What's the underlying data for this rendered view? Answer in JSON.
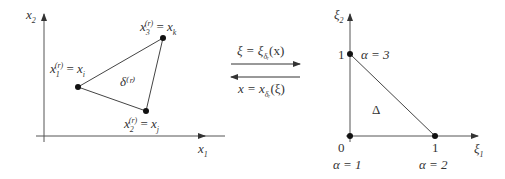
{
  "left_panel": {
    "axis_x_label": "x₁",
    "axis_y_label": "x₂",
    "element_label": "δ⁽ʳ⁾",
    "vertices": [
      {
        "name": "x₁⁽ʳ⁾ = xᵢ",
        "label_base": "x",
        "label_sub": "1",
        "label_sup": "(r)",
        "rhs_base": "x",
        "rhs_sub": "i",
        "point": [
          78,
          87
        ]
      },
      {
        "name": "x₂⁽ʳ⁾ = xⱼ",
        "label_base": "x",
        "label_sub": "2",
        "label_sup": "(r)",
        "rhs_base": "x",
        "rhs_sub": "j",
        "point": [
          146,
          111
        ]
      },
      {
        "name": "x₃⁽ʳ⁾ = xₖ",
        "label_base": "x",
        "label_sub": "3",
        "label_sup": "(r)",
        "rhs_base": "x",
        "rhs_sub": "k",
        "point": [
          163,
          38
        ]
      }
    ]
  },
  "mapping": {
    "forward": "ξ = ξδᵣ(x)",
    "forward_lhs": "ξ = ξ",
    "forward_sub": "δᵣ",
    "forward_arg": "(x)",
    "inverse": "x = xδᵣ(ξ)",
    "inverse_lhs": "x = x",
    "inverse_sub": "δᵣ",
    "inverse_arg": "(ξ)"
  },
  "right_panel": {
    "axis_x_label": "ξ₁",
    "axis_y_label": "ξ₂",
    "element_label": "Δ",
    "origin_label": "0",
    "tick_x_label": "1",
    "tick_y_label": "1",
    "vertices": [
      {
        "alpha_label": "α = 1",
        "point": [
          350,
          136
        ]
      },
      {
        "alpha_label": "α = 2",
        "point": [
          435,
          136
        ]
      },
      {
        "alpha_label": "α = 3",
        "point": [
          350,
          54
        ]
      }
    ]
  }
}
